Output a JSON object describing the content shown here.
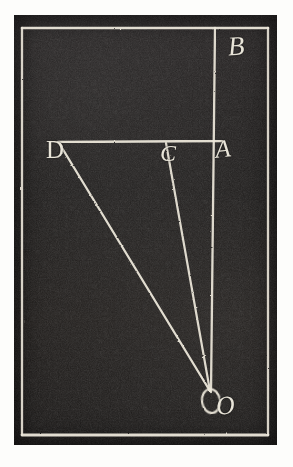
{
  "figure": {
    "medium": "engraving-plate-scan",
    "colors": {
      "paper": "#fdfdfb",
      "plate": "#1c1a18",
      "ink_line": "#e8e4d8"
    },
    "plate": {
      "left": 14,
      "top": 15,
      "width": 263,
      "height": 430
    },
    "frame": {
      "name": "inner-border-rectangle",
      "left": 8,
      "top": 13,
      "right": 254,
      "bottom": 420
    },
    "points": [
      {
        "id": "B",
        "label": "B",
        "x": 200,
        "y": 13
      },
      {
        "id": "D",
        "label": "D",
        "x": 44,
        "y": 126
      },
      {
        "id": "C",
        "label": "C",
        "x": 152,
        "y": 126
      },
      {
        "id": "A",
        "label": "A",
        "x": 200,
        "y": 126
      },
      {
        "id": "O",
        "label": "O",
        "x": 197,
        "y": 377
      }
    ],
    "segments": [
      {
        "id": "BO",
        "name": "vertical-line-B-to-O",
        "from": "B",
        "to": "O"
      },
      {
        "id": "DA",
        "name": "horizontal-line-D-to-A",
        "from": "D",
        "to": "A"
      },
      {
        "id": "DO",
        "name": "line-D-to-O",
        "from": "D",
        "to": "O"
      },
      {
        "id": "CO",
        "name": "line-C-to-O",
        "from": "C",
        "to": "O"
      }
    ],
    "labels": {
      "B": "B",
      "D": "D",
      "C": "C",
      "A": "A",
      "O": "O"
    }
  }
}
